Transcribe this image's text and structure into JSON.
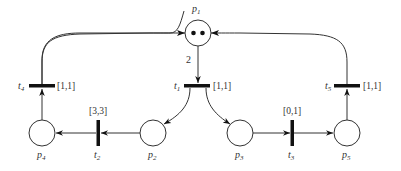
{
  "places": [
    {
      "id": "p1",
      "label": "p",
      "sub": "1",
      "tokens": 2
    },
    {
      "id": "p2",
      "label": "p",
      "sub": "2",
      "tokens": 0
    },
    {
      "id": "p3",
      "label": "p",
      "sub": "3",
      "tokens": 0
    },
    {
      "id": "p4",
      "label": "p",
      "sub": "4",
      "tokens": 0
    },
    {
      "id": "p5",
      "label": "p",
      "sub": "5",
      "tokens": 0
    }
  ],
  "transitions": [
    {
      "id": "t1",
      "label": "t",
      "sub": "1",
      "interval": "[1,1]"
    },
    {
      "id": "t2",
      "label": "t",
      "sub": "2",
      "interval": "[3,3]"
    },
    {
      "id": "t3",
      "label": "t",
      "sub": "3",
      "interval": "[0,1]"
    },
    {
      "id": "t4",
      "label": "t",
      "sub": "4",
      "interval": "[1,1]"
    },
    {
      "id": "t5",
      "label": "t",
      "sub": "5",
      "interval": "[1,1]"
    }
  ],
  "arcs": [
    {
      "from": "p1",
      "to": "t1",
      "weight": "2"
    },
    {
      "from": "t1",
      "to": "p2",
      "weight": ""
    },
    {
      "from": "t1",
      "to": "p3",
      "weight": ""
    },
    {
      "from": "p2",
      "to": "t2",
      "weight": ""
    },
    {
      "from": "t2",
      "to": "p4",
      "weight": ""
    },
    {
      "from": "p3",
      "to": "t3",
      "weight": ""
    },
    {
      "from": "t3",
      "to": "p5",
      "weight": ""
    },
    {
      "from": "p4",
      "to": "t4",
      "weight": ""
    },
    {
      "from": "t4",
      "to": "p1",
      "weight": ""
    },
    {
      "from": "p5",
      "to": "t5",
      "weight": ""
    },
    {
      "from": "t5",
      "to": "p1",
      "weight": ""
    }
  ]
}
